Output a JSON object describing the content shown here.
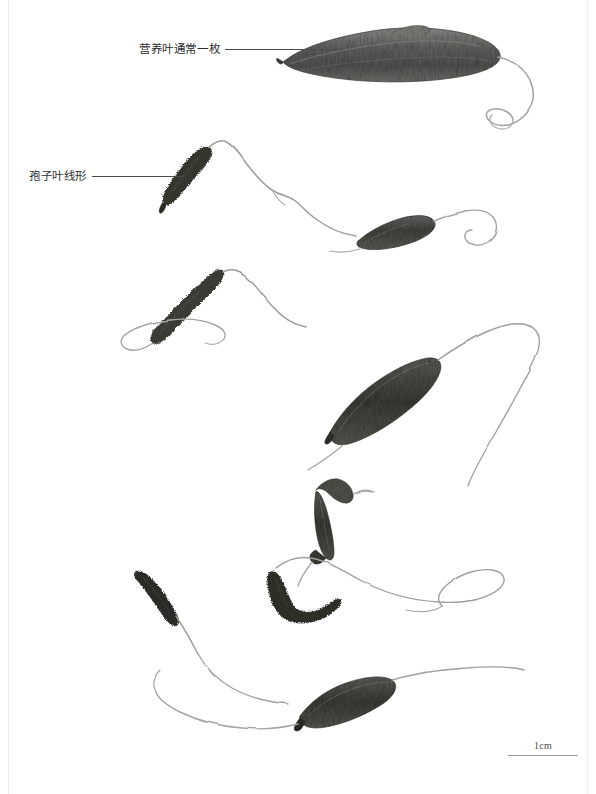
{
  "plate": {
    "background_color": "#ffffff",
    "width": 596,
    "height": 794,
    "frame_color": "#ececed"
  },
  "annotations": [
    {
      "id": "frond",
      "name": "annotation-sterile-frond",
      "text": "营养叶通常一枚",
      "leader_length": 118,
      "x": 139,
      "y": 44
    },
    {
      "id": "sporophyll",
      "name": "annotation-sporophyll",
      "text": "孢子叶线形",
      "leader_length": 92,
      "x": 29,
      "y": 171
    }
  ],
  "scale": {
    "label": "1cm",
    "bar_width_px": 70,
    "color": "#9a9a9e"
  },
  "specimens": {
    "count": 7,
    "type": "pressed herbarium fern specimens",
    "blade_color": "#4a4a47",
    "stipe_color": "#a8a8a6",
    "sporophyll_color": "#2a2a28"
  }
}
